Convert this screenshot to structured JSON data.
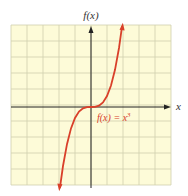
{
  "chart_data": {
    "type": "line",
    "title": "",
    "xlabel": "x",
    "ylabel": "f(x)",
    "function": "f(x) = x^3",
    "annotation": "f(x) = x³",
    "grid": true,
    "grid_cells": [
      10,
      10
    ],
    "axes_arrows": true,
    "tick_labels": false,
    "series": [
      {
        "name": "f(x) = x³",
        "color": "#d9402a",
        "x": [
          -1.94,
          -1.75,
          -1.5,
          -1.25,
          -1.0,
          -0.75,
          -0.5,
          -0.25,
          0,
          0.25,
          0.5,
          0.75,
          1.0,
          1.25,
          1.5,
          1.75,
          1.94
        ],
        "y": [
          -7.3,
          -5.36,
          -3.38,
          -1.95,
          -1.0,
          -0.42,
          -0.125,
          -0.016,
          0,
          0.016,
          0.125,
          0.42,
          1.0,
          1.95,
          3.38,
          5.36,
          7.3
        ]
      }
    ],
    "xlim": [
      -5,
      5
    ],
    "ylim": [
      -5,
      5
    ]
  },
  "labels": {
    "y_axis": "f(x)",
    "x_axis": "x",
    "curve_fx": "f(x) = x",
    "curve_exp": "3"
  },
  "colors": {
    "grid_bg": "#fdfbd8",
    "grid_line": "#c9c9a8",
    "axis": "#222222",
    "curve": "#d9402a"
  }
}
